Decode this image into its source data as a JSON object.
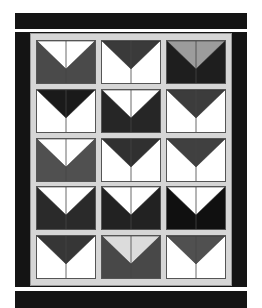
{
  "image": {
    "description": "Quilt pattern illustration: 3x5 grid of flying-geese style blocks with light gray sashing and black borders",
    "width": 262,
    "height": 308
  },
  "colors": {
    "border": "#141414",
    "sashing": "#d6d6d6",
    "sashing_edge": "#9a9a9a",
    "background": "#ffffff"
  },
  "top_bar": {
    "x": 15,
    "y": 13,
    "w": 232,
    "h": 16
  },
  "frame": {
    "x": 15,
    "y": 32,
    "w": 232,
    "h": 255
  },
  "inner": {
    "x": 30,
    "y": 33,
    "w": 202,
    "h": 253
  },
  "bottom_bar": {
    "x": 15,
    "y": 291,
    "w": 232,
    "h": 17
  },
  "grid": {
    "columns_x": [
      37,
      102,
      167
    ],
    "rows_y": [
      41,
      90,
      139,
      187,
      236
    ],
    "block_w": 58,
    "block_h": 42,
    "v_depth": 0.66
  },
  "blocks": [
    [
      {
        "v": "#ffffff",
        "bg": "#4a4a4a"
      },
      {
        "v": "#3a3a3a",
        "bg": "#ffffff"
      },
      {
        "v": "#9c9c9c",
        "bg": "#1e1e1e"
      }
    ],
    [
      {
        "v": "#1a1a1a",
        "bg": "#ffffff"
      },
      {
        "v": "#ffffff",
        "bg": "#262626"
      },
      {
        "v": "#3c3c3c",
        "bg": "#ffffff"
      }
    ],
    [
      {
        "v": "#ffffff",
        "bg": "#505050"
      },
      {
        "v": "#303030",
        "bg": "#ffffff"
      },
      {
        "v": "#404040",
        "bg": "#ffffff"
      }
    ],
    [
      {
        "v": "#ffffff",
        "bg": "#2a2a2a"
      },
      {
        "v": "#ffffff",
        "bg": "#222222"
      },
      {
        "v": "#ffffff",
        "bg": "#101010"
      }
    ],
    [
      {
        "v": "#363636",
        "bg": "#ffffff"
      },
      {
        "v": "#dcdcdc",
        "bg": "#484848"
      },
      {
        "v": "#505050",
        "bg": "#ffffff"
      }
    ]
  ]
}
